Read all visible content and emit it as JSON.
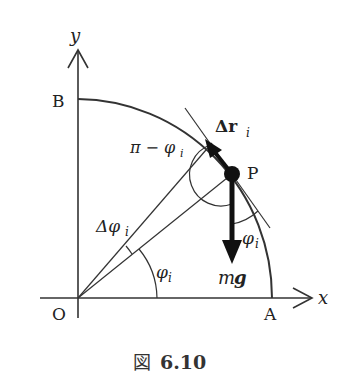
{
  "figure": {
    "caption_prefix": "図",
    "caption_number": "6.10"
  },
  "axes": {
    "x_label": "x",
    "y_label": "y",
    "origin_label": "O"
  },
  "points": {
    "A": "A",
    "B": "B",
    "P": "P"
  },
  "labels": {
    "delta_r": "Δr",
    "delta_r_sub": "i",
    "pi_minus_phi": "π − φ",
    "pi_minus_phi_sub": "i",
    "delta_phi": "Δφ",
    "delta_phi_sub": "i",
    "phi_origin": "φ",
    "phi_origin_sub": "i",
    "phi_p": "φ",
    "phi_p_sub": "i",
    "force_m": "m",
    "force_g": "g"
  },
  "colors": {
    "line": "#333333",
    "vector": "#111111"
  }
}
